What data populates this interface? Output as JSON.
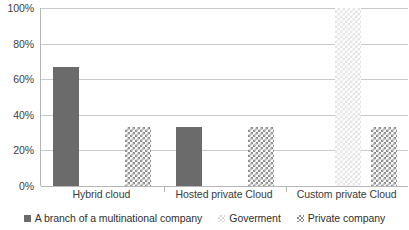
{
  "chart_data": {
    "type": "bar",
    "title": "",
    "subtitle": "",
    "xlabel": "",
    "ylabel": "",
    "categories": [
      "Hybrid cloud",
      "Hosted private Cloud",
      "Custom private Cloud"
    ],
    "series": [
      {
        "name": "A branch of a multinational company",
        "pattern": "solid",
        "color": "#6b6b6b",
        "values": [
          66.7,
          33.3,
          0
        ]
      },
      {
        "name": "Goverment",
        "pattern": "light-checker",
        "color": "#e3e3e3",
        "values": [
          0,
          0,
          100
        ]
      },
      {
        "name": "Private company",
        "pattern": "gray-checker",
        "color": "#8d8d8d",
        "values": [
          33.3,
          33.3,
          33.3
        ]
      }
    ],
    "ylim": [
      0,
      100
    ],
    "y_ticks": [
      0,
      20,
      40,
      60,
      80,
      100
    ],
    "y_tick_labels": [
      "0%",
      "20%",
      "40%",
      "60%",
      "80%",
      "100%"
    ],
    "grid": true,
    "grid_axis": "y",
    "legend_position": "bottom",
    "value_suffix": "%"
  }
}
